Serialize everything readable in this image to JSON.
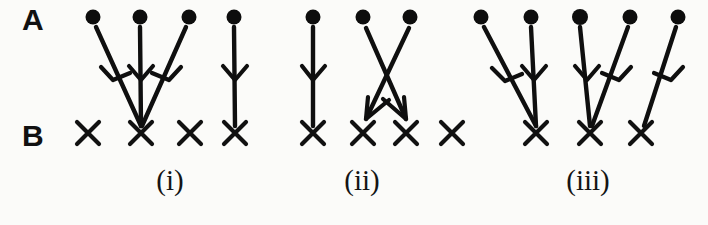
{
  "figure": {
    "width": 708,
    "height": 225,
    "background_color": "#fbfbf9",
    "ink_color": "#111111"
  },
  "row_labels": [
    {
      "id": "row-a",
      "text": "A",
      "x": 22,
      "y": 28,
      "description": "top row of filled dot nodes"
    },
    {
      "id": "row-b",
      "text": "B",
      "x": 22,
      "y": 144,
      "description": "bottom row of X nodes"
    }
  ],
  "captions": [
    {
      "id": "caption-i",
      "text": "(i)",
      "x": 170,
      "y": 190
    },
    {
      "id": "caption-ii",
      "text": "(ii)",
      "x": 362,
      "y": 190
    },
    {
      "id": "caption-iii",
      "text": "(iii)",
      "x": 588,
      "y": 190
    }
  ],
  "geometry": {
    "row_a_y": 17,
    "row_b_y": 133,
    "dot_radius": 7.5,
    "x_half_size": 11
  },
  "groups": [
    {
      "id": "group-i",
      "caption": "(i)",
      "a_nodes": [
        {
          "id": "i-a1",
          "x": 93
        },
        {
          "id": "i-a2",
          "x": 140
        },
        {
          "id": "i-a3",
          "x": 189
        },
        {
          "id": "i-a4",
          "x": 234
        }
      ],
      "b_nodes": [
        {
          "id": "i-b1",
          "x": 88
        },
        {
          "id": "i-b2",
          "x": 141
        },
        {
          "id": "i-b3",
          "x": 190
        },
        {
          "id": "i-b4",
          "x": 235
        }
      ],
      "edges": [
        {
          "id": "i-e1",
          "from": "i-a1",
          "to": "i-b2",
          "from_x": 93,
          "to_x": 141
        },
        {
          "id": "i-e2",
          "from": "i-a2",
          "to": "i-b2",
          "from_x": 140,
          "to_x": 141
        },
        {
          "id": "i-e3",
          "from": "i-a3",
          "to": "i-b2",
          "from_x": 189,
          "to_x": 141
        },
        {
          "id": "i-e4",
          "from": "i-a4",
          "to": "i-b4",
          "from_x": 234,
          "to_x": 235
        }
      ]
    },
    {
      "id": "group-ii",
      "caption": "(ii)",
      "a_nodes": [
        {
          "id": "ii-a1",
          "x": 313
        },
        {
          "id": "ii-a2",
          "x": 363
        },
        {
          "id": "ii-a3",
          "x": 410
        }
      ],
      "b_nodes": [
        {
          "id": "ii-b1",
          "x": 313
        },
        {
          "id": "ii-b2",
          "x": 363
        },
        {
          "id": "ii-b3",
          "x": 406
        },
        {
          "id": "ii-b4",
          "x": 452
        }
      ],
      "edges": [
        {
          "id": "ii-e1",
          "from": "ii-a1",
          "to": "ii-b1",
          "from_x": 313,
          "to_x": 313
        },
        {
          "id": "ii-e2",
          "from": "ii-a2",
          "to": "ii-b3",
          "from_x": 363,
          "to_x": 406
        },
        {
          "id": "ii-e3",
          "from": "ii-a3",
          "to": "ii-b2",
          "from_x": 410,
          "to_x": 366
        }
      ]
    },
    {
      "id": "group-iii",
      "caption": "(iii)",
      "a_nodes": [
        {
          "id": "iii-a1",
          "x": 481
        },
        {
          "id": "iii-a2",
          "x": 531
        },
        {
          "id": "iii-a3",
          "x": 580
        },
        {
          "id": "iii-a4",
          "x": 630
        },
        {
          "id": "iii-a5",
          "x": 678
        }
      ],
      "b_nodes": [
        {
          "id": "iii-b1",
          "x": 536
        },
        {
          "id": "iii-b2",
          "x": 590
        },
        {
          "id": "iii-b3",
          "x": 641
        }
      ],
      "edges": [
        {
          "id": "iii-e1",
          "from": "iii-a1",
          "to": "iii-b1",
          "from_x": 481,
          "to_x": 536
        },
        {
          "id": "iii-e2",
          "from": "iii-a2",
          "to": "iii-b1",
          "from_x": 531,
          "to_x": 536
        },
        {
          "id": "iii-e3",
          "from": "iii-a3",
          "to": "iii-b2",
          "from_x": 580,
          "to_x": 590
        },
        {
          "id": "iii-e4",
          "from": "iii-a4",
          "to": "iii-b2",
          "from_x": 630,
          "to_x": 593
        },
        {
          "id": "iii-e5",
          "from": "iii-a5",
          "to": "iii-b3",
          "from_x": 678,
          "to_x": 645
        }
      ]
    }
  ]
}
